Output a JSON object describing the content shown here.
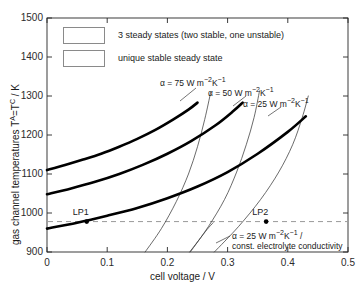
{
  "chart_data": {
    "type": "line",
    "title": "",
    "xlabel": "cell voltage / V",
    "ylabel": "gas channel temperatures T^A=T^C / K",
    "ylabel_parts": {
      "pre": "gas channel temperatures T",
      "sup1": "A",
      "mid": "=T",
      "sup2": "C",
      "post": " / K"
    },
    "xlim": [
      0,
      0.5
    ],
    "ylim": [
      900,
      1500
    ],
    "xticks": [
      "0",
      "0.1",
      "0.2",
      "0.3",
      "0.4",
      "0.5"
    ],
    "xtick_values": [
      0,
      0.1,
      0.2,
      0.3,
      0.4,
      0.5
    ],
    "yticks": [
      "900",
      "1000",
      "1100",
      "1200",
      "1300",
      "1400",
      "1500"
    ],
    "ytick_values": [
      900,
      1000,
      1100,
      1200,
      1300,
      1400,
      1500
    ],
    "grid": false,
    "legend_position": "top-left",
    "legend": [
      {
        "label": "3 steady states (two stable, one unstable)",
        "swatch": "white"
      },
      {
        "label": "unique stable steady state",
        "swatch": "white"
      }
    ],
    "reference_line": {
      "value": 978,
      "style": "dashed",
      "orientation": "horizontal"
    },
    "series": [
      {
        "name": "alpha = 75 W m^-2 K^-1 (fold branch, thick)",
        "style": "thick",
        "points": [
          [
            0.0,
            1110
          ],
          [
            0.03,
            1123
          ],
          [
            0.06,
            1137
          ],
          [
            0.09,
            1152
          ],
          [
            0.12,
            1170
          ],
          [
            0.15,
            1190
          ],
          [
            0.18,
            1213
          ],
          [
            0.21,
            1240
          ],
          [
            0.235,
            1265
          ],
          [
            0.25,
            1283
          ]
        ]
      },
      {
        "name": "alpha = 50 W m^-2 K^-1 (fold branch, thick)",
        "style": "thick",
        "points": [
          [
            0.0,
            1048
          ],
          [
            0.04,
            1063
          ],
          [
            0.08,
            1080
          ],
          [
            0.12,
            1100
          ],
          [
            0.16,
            1124
          ],
          [
            0.2,
            1152
          ],
          [
            0.24,
            1185
          ],
          [
            0.28,
            1225
          ],
          [
            0.31,
            1262
          ],
          [
            0.325,
            1283
          ]
        ]
      },
      {
        "name": "alpha = 25 W m^-2 K^-1 (fold branch, thick)",
        "style": "thick",
        "points": [
          [
            0.0,
            960
          ],
          [
            0.05,
            975
          ],
          [
            0.1,
            993
          ],
          [
            0.15,
            1013
          ],
          [
            0.2,
            1038
          ],
          [
            0.25,
            1068
          ],
          [
            0.3,
            1105
          ],
          [
            0.35,
            1152
          ],
          [
            0.4,
            1208
          ],
          [
            0.43,
            1248
          ]
        ]
      },
      {
        "name": "alpha = 75 W m^-2 K^-1 (unique branch, thin)",
        "style": "thin",
        "points": [
          [
            0.163,
            900
          ],
          [
            0.19,
            960
          ],
          [
            0.215,
            1030
          ],
          [
            0.235,
            1100
          ],
          [
            0.25,
            1170
          ],
          [
            0.262,
            1240
          ],
          [
            0.272,
            1310
          ]
        ]
      },
      {
        "name": "alpha = 50 W m^-2 K^-1 (unique branch, thin)",
        "style": "thin",
        "points": [
          [
            0.238,
            900
          ],
          [
            0.268,
            965
          ],
          [
            0.295,
            1035
          ],
          [
            0.315,
            1105
          ],
          [
            0.331,
            1175
          ],
          [
            0.344,
            1245
          ],
          [
            0.353,
            1313
          ]
        ]
      },
      {
        "name": "alpha = 25 W m^-2 K^-1 (unique branch, thin)",
        "style": "thin",
        "points": [
          [
            0.278,
            900
          ],
          [
            0.318,
            965
          ],
          [
            0.355,
            1035
          ],
          [
            0.385,
            1105
          ],
          [
            0.408,
            1175
          ],
          [
            0.424,
            1245
          ],
          [
            0.434,
            1300
          ]
        ]
      },
      {
        "name": "alpha = 25 W m^-2 K^-1 const. electrolyte conductivity (thin)",
        "style": "thin",
        "points": [
          [
            0.237,
            900
          ],
          [
            0.252,
            930
          ],
          [
            0.266,
            958
          ],
          [
            0.276,
            975
          ]
        ]
      }
    ],
    "markers": [
      {
        "label": "LP1",
        "x": 0.066,
        "y": 978,
        "marker": "dot"
      },
      {
        "label": "LP2",
        "x": 0.364,
        "y": 978,
        "marker": "dot"
      }
    ],
    "annotations": [
      {
        "id": "a75",
        "text": "α = 75 W m⁻²K⁻¹",
        "parts": {
          "lead": "α = 75 W m",
          "sup1": "−2",
          "mid": "K",
          "sup2": "−1"
        }
      },
      {
        "id": "a50",
        "text": "α = 50 W m⁻²K⁻¹",
        "parts": {
          "lead": "α = 50 W m",
          "sup1": "−2",
          "mid": "K",
          "sup2": "−1"
        }
      },
      {
        "id": "a25",
        "text": "α = 25 W m⁻²K⁻¹",
        "parts": {
          "lead": "α = 25 W m",
          "sup1": "−2",
          "mid": "K",
          "sup2": "−1"
        }
      },
      {
        "id": "a25c_line1",
        "text": "α = 25 W m⁻²K⁻¹ /",
        "parts": {
          "lead": "α = 25 W m",
          "sup1": "−2",
          "mid": "K",
          "sup2": "−1",
          "tail": " /"
        }
      },
      {
        "id": "a25c_line2",
        "text": "const. electrolyte conductivity"
      }
    ],
    "colors": {
      "axis": "#262626",
      "thick_curve": "#000000",
      "thin_curve": "#3a3a3a",
      "dashed_line": "#9a9a9a",
      "background": "#ffffff",
      "legend_border": "#8a8a8a"
    }
  }
}
